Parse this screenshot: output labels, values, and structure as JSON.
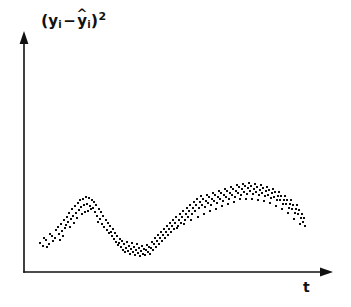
{
  "figure": {
    "background_color": "#ffffff",
    "ink_color": "#111111",
    "width": 351,
    "height": 307
  },
  "axes": {
    "y_axis": {
      "label_text": "(yi - ŷi)²",
      "label_open_paren": "(",
      "label_var": "y",
      "label_sub": "i",
      "label_minus": "−",
      "label_hat": "^",
      "label_var2": "y",
      "label_sub2": "i",
      "label_close_paren": ")",
      "label_sup": "2",
      "has_arrow": true,
      "x_px": 24,
      "top_px": 35,
      "bottom_px": 272
    },
    "x_axis": {
      "label_text": "t",
      "has_arrow": true,
      "y_px": 272,
      "left_px": 24,
      "right_px": 330
    }
  },
  "chart_data": {
    "type": "scatter",
    "title": "",
    "xlabel": "t",
    "ylabel": "(yi - ŷi)²",
    "grid": false,
    "legend": null,
    "axis_ticks": {
      "x": [],
      "y": []
    },
    "xlim": [
      24,
      330
    ],
    "ylim": [
      272,
      35
    ],
    "dot_color": "#0d0d0d",
    "dot_size_px": 2,
    "band_thickness_px": 22,
    "series": [
      {
        "name": "squared residuals",
        "points": [
          [
            40,
            243
          ],
          [
            44,
            238
          ],
          [
            47,
            247
          ],
          [
            50,
            234
          ],
          [
            53,
            241
          ],
          [
            56,
            230
          ],
          [
            43,
            246
          ],
          [
            46,
            240
          ],
          [
            49,
            244
          ],
          [
            52,
            236
          ],
          [
            55,
            238
          ],
          [
            58,
            227
          ],
          [
            59,
            234
          ],
          [
            61,
            224
          ],
          [
            62,
            231
          ],
          [
            64,
            220
          ],
          [
            65,
            228
          ],
          [
            67,
            217
          ],
          [
            60,
            240
          ],
          [
            63,
            236
          ],
          [
            66,
            225
          ],
          [
            68,
            222
          ],
          [
            69,
            213
          ],
          [
            71,
            219
          ],
          [
            72,
            209
          ],
          [
            73,
            216
          ],
          [
            75,
            206
          ],
          [
            76,
            213
          ],
          [
            78,
            203
          ],
          [
            79,
            210
          ],
          [
            70,
            227
          ],
          [
            74,
            223
          ],
          [
            77,
            218
          ],
          [
            80,
            200
          ],
          [
            81,
            207
          ],
          [
            83,
            199
          ],
          [
            84,
            205
          ],
          [
            86,
            197
          ],
          [
            87,
            204
          ],
          [
            89,
            198
          ],
          [
            90,
            206
          ],
          [
            92,
            200
          ],
          [
            82,
            214
          ],
          [
            85,
            212
          ],
          [
            88,
            211
          ],
          [
            91,
            209
          ],
          [
            93,
            208
          ],
          [
            94,
            202
          ],
          [
            95,
            212
          ],
          [
            96,
            205
          ],
          [
            97,
            216
          ],
          [
            99,
            209
          ],
          [
            100,
            219
          ],
          [
            101,
            212
          ],
          [
            98,
            222
          ],
          [
            102,
            224
          ],
          [
            103,
            216
          ],
          [
            104,
            227
          ],
          [
            106,
            220
          ],
          [
            107,
            230
          ],
          [
            108,
            223
          ],
          [
            109,
            233
          ],
          [
            110,
            226
          ],
          [
            112,
            236
          ],
          [
            113,
            229
          ],
          [
            114,
            239
          ],
          [
            111,
            232
          ],
          [
            115,
            233
          ],
          [
            116,
            242
          ],
          [
            117,
            236
          ],
          [
            118,
            245
          ],
          [
            120,
            239
          ],
          [
            121,
            247
          ],
          [
            122,
            241
          ],
          [
            123,
            250
          ],
          [
            124,
            244
          ],
          [
            126,
            248
          ],
          [
            127,
            242
          ],
          [
            119,
            243
          ],
          [
            125,
            252
          ],
          [
            128,
            251
          ],
          [
            129,
            246
          ],
          [
            130,
            254
          ],
          [
            131,
            249
          ],
          [
            132,
            243
          ],
          [
            133,
            252
          ],
          [
            134,
            247
          ],
          [
            135,
            255
          ],
          [
            136,
            250
          ],
          [
            137,
            244
          ],
          [
            138,
            253
          ],
          [
            139,
            248
          ],
          [
            140,
            256
          ],
          [
            141,
            251
          ],
          [
            142,
            246
          ],
          [
            143,
            254
          ],
          [
            144,
            249
          ],
          [
            145,
            255
          ],
          [
            146,
            250
          ],
          [
            147,
            245
          ],
          [
            148,
            252
          ],
          [
            149,
            247
          ],
          [
            150,
            254
          ],
          [
            151,
            248
          ],
          [
            152,
            242
          ],
          [
            153,
            250
          ],
          [
            154,
            244
          ],
          [
            155,
            238
          ],
          [
            156,
            247
          ],
          [
            157,
            241
          ],
          [
            158,
            235
          ],
          [
            159,
            244
          ],
          [
            160,
            238
          ],
          [
            161,
            232
          ],
          [
            162,
            241
          ],
          [
            163,
            235
          ],
          [
            164,
            229
          ],
          [
            165,
            238
          ],
          [
            166,
            232
          ],
          [
            167,
            226
          ],
          [
            168,
            235
          ],
          [
            169,
            229
          ],
          [
            170,
            223
          ],
          [
            171,
            232
          ],
          [
            172,
            226
          ],
          [
            173,
            220
          ],
          [
            174,
            229
          ],
          [
            175,
            223
          ],
          [
            176,
            217
          ],
          [
            178,
            226
          ],
          [
            179,
            220
          ],
          [
            180,
            214
          ],
          [
            181,
            223
          ],
          [
            182,
            217
          ],
          [
            183,
            211
          ],
          [
            185,
            220
          ],
          [
            186,
            214
          ],
          [
            187,
            208
          ],
          [
            188,
            217
          ],
          [
            189,
            211
          ],
          [
            190,
            205
          ],
          [
            192,
            214
          ],
          [
            193,
            208
          ],
          [
            194,
            202
          ],
          [
            195,
            211
          ],
          [
            196,
            205
          ],
          [
            197,
            199
          ],
          [
            199,
            208
          ],
          [
            200,
            202
          ],
          [
            201,
            196
          ],
          [
            202,
            205
          ],
          [
            203,
            199
          ],
          [
            205,
            207
          ],
          [
            206,
            201
          ],
          [
            207,
            195
          ],
          [
            208,
            203
          ],
          [
            209,
            197
          ],
          [
            211,
            205
          ],
          [
            212,
            199
          ],
          [
            213,
            193
          ],
          [
            214,
            201
          ],
          [
            215,
            195
          ],
          [
            217,
            203
          ],
          [
            218,
            197
          ],
          [
            219,
            191
          ],
          [
            220,
            199
          ],
          [
            221,
            193
          ],
          [
            223,
            201
          ],
          [
            224,
            195
          ],
          [
            225,
            189
          ],
          [
            226,
            197
          ],
          [
            227,
            191
          ],
          [
            229,
            199
          ],
          [
            230,
            193
          ],
          [
            231,
            187
          ],
          [
            232,
            195
          ],
          [
            233,
            189
          ],
          [
            235,
            197
          ],
          [
            236,
            191
          ],
          [
            237,
            185
          ],
          [
            238,
            193
          ],
          [
            239,
            187
          ],
          [
            241,
            195
          ],
          [
            242,
            189
          ],
          [
            243,
            184
          ],
          [
            244,
            192
          ],
          [
            245,
            186
          ],
          [
            247,
            194
          ],
          [
            248,
            188
          ],
          [
            249,
            183
          ],
          [
            250,
            191
          ],
          [
            251,
            186
          ],
          [
            253,
            194
          ],
          [
            254,
            189
          ],
          [
            255,
            184
          ],
          [
            256,
            192
          ],
          [
            257,
            187
          ],
          [
            259,
            195
          ],
          [
            260,
            190
          ],
          [
            261,
            185
          ],
          [
            262,
            193
          ],
          [
            263,
            188
          ],
          [
            265,
            196
          ],
          [
            266,
            191
          ],
          [
            267,
            187
          ],
          [
            268,
            195
          ],
          [
            269,
            190
          ],
          [
            271,
            198
          ],
          [
            272,
            193
          ],
          [
            273,
            189
          ],
          [
            274,
            197
          ],
          [
            275,
            192
          ],
          [
            277,
            200
          ],
          [
            278,
            196
          ],
          [
            279,
            192
          ],
          [
            280,
            200
          ],
          [
            281,
            196
          ],
          [
            283,
            204
          ],
          [
            284,
            200
          ],
          [
            285,
            196
          ],
          [
            286,
            204
          ],
          [
            287,
            200
          ],
          [
            289,
            208
          ],
          [
            290,
            204
          ],
          [
            291,
            200
          ],
          [
            292,
            209
          ],
          [
            293,
            205
          ],
          [
            295,
            213
          ],
          [
            296,
            209
          ],
          [
            297,
            205
          ],
          [
            298,
            214
          ],
          [
            299,
            210
          ],
          [
            301,
            218
          ],
          [
            302,
            214
          ],
          [
            303,
            222
          ],
          [
            304,
            218
          ],
          [
            305,
            226
          ],
          [
            300,
            224
          ],
          [
            294,
            219
          ],
          [
            288,
            213
          ],
          [
            282,
            209
          ],
          [
            276,
            206
          ],
          [
            270,
            203
          ],
          [
            264,
            201
          ],
          [
            258,
            200
          ],
          [
            252,
            199
          ],
          [
            246,
            199
          ],
          [
            240,
            199
          ],
          [
            234,
            202
          ],
          [
            228,
            204
          ],
          [
            222,
            206
          ],
          [
            216,
            209
          ],
          [
            210,
            211
          ],
          [
            204,
            214
          ],
          [
            198,
            217
          ],
          [
            191,
            220
          ],
          [
            184,
            224
          ],
          [
            177,
            228
          ]
        ]
      }
    ]
  }
}
